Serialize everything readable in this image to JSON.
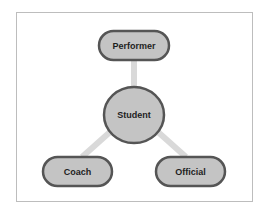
{
  "diagram": {
    "center": {
      "label": "Student"
    },
    "nodes": [
      {
        "label": "Performer"
      },
      {
        "label": "Coach"
      },
      {
        "label": "Official"
      }
    ],
    "colors": {
      "node_fill": "#c4c4c4",
      "node_stroke": "#555555",
      "connector": "#d9d9d9",
      "frame": "#bdbdbd"
    }
  }
}
